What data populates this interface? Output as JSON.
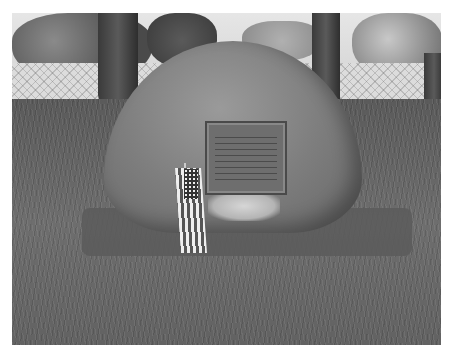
{
  "image": {
    "description": "Grayscale photo of a large boulder memorial with a bronze plaque, a small American flag in front, trees and a chain-link fence behind, and a grassy lawn",
    "subjects": [
      "boulder",
      "memorial-plaque",
      "american-flag",
      "trees",
      "chain-link-fence",
      "grass-lawn"
    ],
    "color_mode": "grayscale"
  }
}
